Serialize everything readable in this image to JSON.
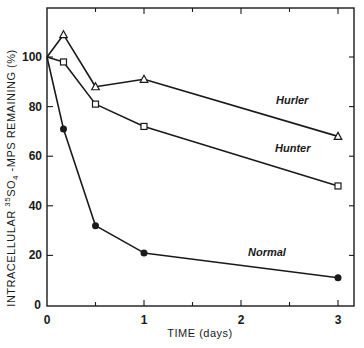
{
  "chart_data": {
    "type": "line",
    "title": "",
    "xlabel": "TIME (days)",
    "ylabel": "INTRACELLULAR 35SO4-MPS REMAINING (%)",
    "ylabel_parts": {
      "pre": "INTRACELLULAR ",
      "sup": "35",
      "mid": "SO",
      "sub": "4",
      "post": " -MPS  REMAINING (%)"
    },
    "xlim": [
      0,
      3.1
    ],
    "ylim": [
      0,
      115
    ],
    "x_ticks": [
      0,
      1,
      2,
      3
    ],
    "x_tick_labels": [
      "0",
      "1",
      "2",
      "3"
    ],
    "y_ticks": [
      0,
      20,
      40,
      60,
      80,
      100
    ],
    "y_tick_labels": [
      "0",
      "20",
      "40",
      "60",
      "80",
      "100"
    ],
    "grid": false,
    "legend": "inline labels",
    "series": [
      {
        "name": "Hurler",
        "marker": "open-triangle",
        "x": [
          0,
          0.17,
          0.5,
          1,
          3
        ],
        "values": [
          100,
          109,
          88,
          91,
          68
        ]
      },
      {
        "name": "Hunter",
        "marker": "open-square",
        "x": [
          0,
          0.17,
          0.5,
          1,
          3
        ],
        "values": [
          100,
          98,
          81,
          72,
          48
        ]
      },
      {
        "name": "Normal",
        "marker": "filled-circle",
        "x": [
          0,
          0.17,
          0.5,
          1,
          3
        ],
        "values": [
          100,
          71,
          32,
          21,
          11
        ]
      }
    ]
  }
}
